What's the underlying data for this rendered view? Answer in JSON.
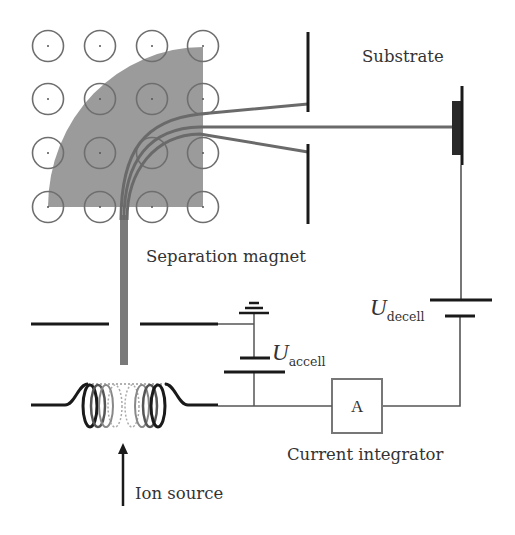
{
  "diagram": {
    "labels": {
      "substrate": "Substrate",
      "separation_magnet": "Separation magnet",
      "u_symbol": "U",
      "u_decel_sub": "decell",
      "u_accel_sub": "accell",
      "ammeter": "A",
      "current_integrator": "Current integrator",
      "ion_source": "Ion source"
    },
    "colors": {
      "magnet_fill": "#999999",
      "beam": "#7a7a7a",
      "wire": "#555555",
      "electrode": "#1a1a1a",
      "circle": "#6e6e6e"
    },
    "components": [
      {
        "name": "ion-source-coil",
        "type": "coil"
      },
      {
        "name": "extraction-electrodes",
        "type": "electrode-pair"
      },
      {
        "name": "accel-voltage-battery",
        "type": "battery",
        "label": "U_accell"
      },
      {
        "name": "ground",
        "type": "ground"
      },
      {
        "name": "separation-magnet",
        "type": "magnet",
        "field": "out-of-page grid 4x4"
      },
      {
        "name": "mass-selection-slit",
        "type": "slit"
      },
      {
        "name": "substrate",
        "type": "target"
      },
      {
        "name": "decel-voltage-battery",
        "type": "battery",
        "label": "U_decell"
      },
      {
        "name": "current-integrator",
        "type": "ammeter",
        "label": "A"
      }
    ]
  }
}
